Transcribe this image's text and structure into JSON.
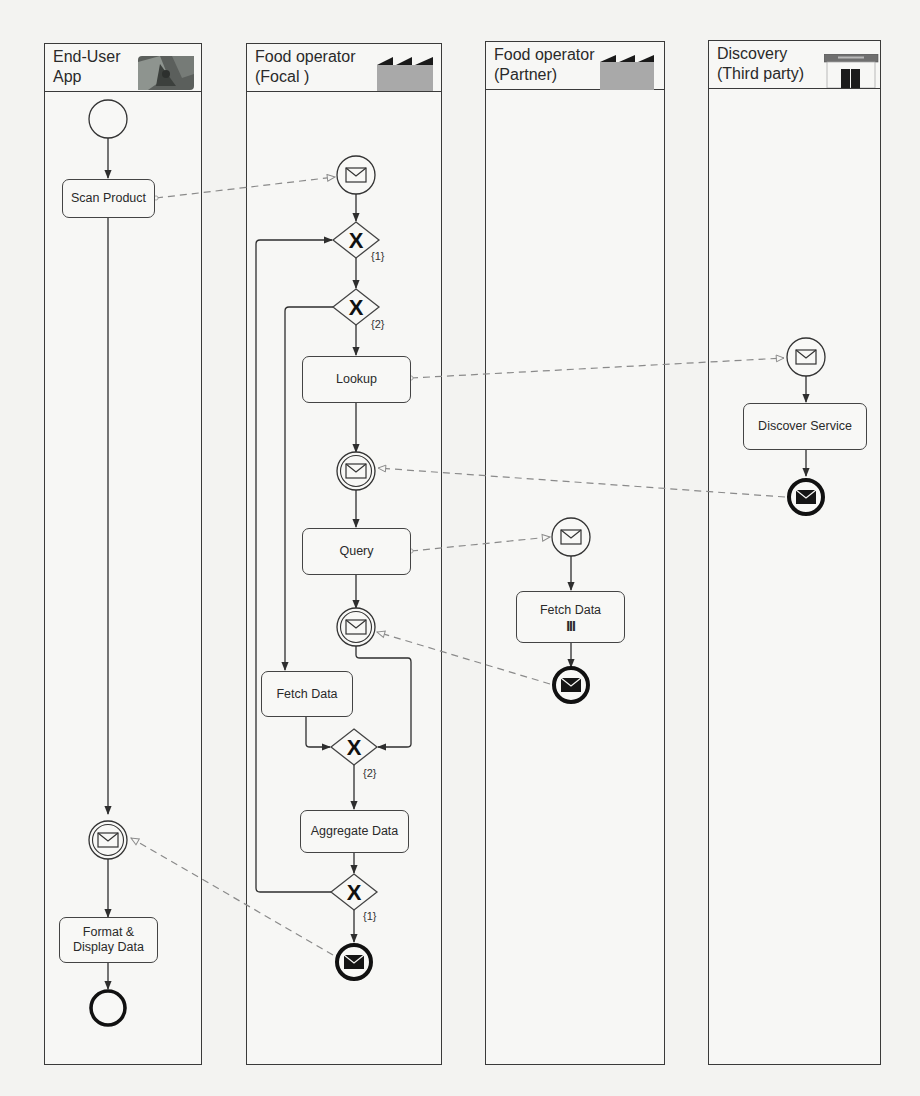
{
  "diagram": {
    "type": "BPMN collaboration",
    "colors": {
      "line": "#3a3a3a",
      "message_flow": "#8a8a8a",
      "factory_fill": "#a9a9a9",
      "factory_roof": "#1a1a1a",
      "background": "#f3f3f1"
    }
  },
  "lanes": [
    {
      "id": "end-user-app",
      "title": "End-User\nApp",
      "icon": "mobile-app-photo-icon"
    },
    {
      "id": "food-operator-focal",
      "title": "Food operator\n(Focal )",
      "icon": "factory-icon"
    },
    {
      "id": "food-operator-partner",
      "title": "Food operator\n(Partner)",
      "icon": "factory-icon"
    },
    {
      "id": "discovery-third-party",
      "title": "Discovery\n(Third party)",
      "icon": "storefront-icon"
    }
  ],
  "tasks": {
    "scan_product": "Scan Product",
    "format_display": "Format &\nDisplay Data",
    "lookup": "Lookup",
    "query": "Query",
    "fetch_data_focal": "Fetch Data",
    "aggregate_data": "Aggregate Data",
    "fetch_data_partner": "Fetch Data",
    "fetch_data_partner_marker": "III",
    "discover_service": "Discover Service"
  },
  "gateways": {
    "split_1": "{1}",
    "split_2": "{2}",
    "join_2": "{2}",
    "join_1": "{1}",
    "symbol": "X"
  },
  "events": [
    {
      "id": "user-start",
      "kind": "none-start"
    },
    {
      "id": "user-receive",
      "kind": "message-intermediate-catch"
    },
    {
      "id": "user-end",
      "kind": "none-end"
    },
    {
      "id": "focal-start",
      "kind": "message-start"
    },
    {
      "id": "focal-lookup-receive",
      "kind": "message-intermediate-catch"
    },
    {
      "id": "focal-query-receive",
      "kind": "message-intermediate-catch"
    },
    {
      "id": "focal-end",
      "kind": "message-end"
    },
    {
      "id": "partner-start",
      "kind": "message-start"
    },
    {
      "id": "partner-end",
      "kind": "message-end"
    },
    {
      "id": "discovery-start",
      "kind": "message-start"
    },
    {
      "id": "discovery-end",
      "kind": "message-end"
    }
  ]
}
